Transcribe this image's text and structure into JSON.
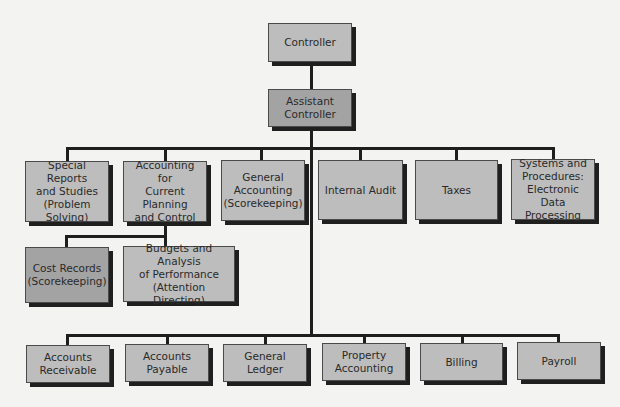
{
  "colors": {
    "background": "#f3f3f1",
    "box_fill": "#bdbdbd",
    "box_fill_highlight": "#a3a3a3",
    "connector": "#1e1e1e",
    "shadow": "#1f1f1f"
  },
  "chart": {
    "root": {
      "label": "Controller"
    },
    "assistant": {
      "label": "Assistant\nController"
    },
    "staff_units": [
      {
        "label": "Special Reports\nand Studies\n(Problem\nSolving)"
      },
      {
        "label": "Accounting for\nCurrent Planning\nand Control"
      },
      {
        "label": "General\nAccounting\n(Scorekeeping)"
      },
      {
        "label": "Internal Audit"
      },
      {
        "label": "Taxes"
      },
      {
        "label": "Systems and\nProcedures:\nElectronic Data\nProcessing"
      }
    ],
    "planning_subunits": [
      {
        "label": "Cost Records\n(Scorekeeping)"
      },
      {
        "label": "Budgets and Analysis\nof Performance\n(Attention Directing)"
      }
    ],
    "operations_units": [
      {
        "label": "Accounts\nReceivable"
      },
      {
        "label": "Accounts\nPayable"
      },
      {
        "label": "General\nLedger"
      },
      {
        "label": "Property\nAccounting"
      },
      {
        "label": "Billing"
      },
      {
        "label": "Payroll"
      }
    ]
  }
}
